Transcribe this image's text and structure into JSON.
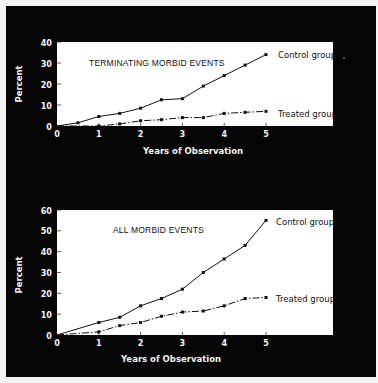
{
  "colors": {
    "background": "#050505",
    "plot_area": "#ffffff",
    "line": "#111111",
    "text_light": "#f2f2f2"
  },
  "charts": [
    {
      "id": "top",
      "title": "TERMINATING MORBID EVENTS",
      "ylabel": "Percent",
      "xlabel": "Years of Observation",
      "y_ticks": [
        "0",
        "10",
        "20",
        "30",
        "40"
      ],
      "x_ticks": [
        "0",
        "1",
        "2",
        "3",
        "4",
        "5"
      ],
      "series_labels": {
        "control": "Control group",
        "treated": "Treated group"
      }
    },
    {
      "id": "bottom",
      "title": "ALL MORBID EVENTS",
      "ylabel": "Percent",
      "xlabel": "Years of Observation",
      "y_ticks": [
        "0",
        "10",
        "20",
        "30",
        "40",
        "50",
        "60"
      ],
      "x_ticks": [
        "0",
        "1",
        "2",
        "3",
        "4",
        "5"
      ],
      "series_labels": {
        "control": "Control group",
        "treated": "Treated group"
      }
    }
  ],
  "chart_data": [
    {
      "type": "line",
      "title": "TERMINATING MORBID EVENTS",
      "xlabel": "Years of Observation",
      "ylabel": "Percent",
      "x": [
        0,
        0.5,
        1,
        1.5,
        2,
        2.5,
        3,
        3.5,
        4,
        4.5,
        5
      ],
      "series": [
        {
          "name": "Control group",
          "style": "solid",
          "x": [
            0,
            0.5,
            1,
            1.5,
            2,
            2.5,
            3,
            3.5,
            4,
            4.5,
            5
          ],
          "values": [
            0,
            1.5,
            4.5,
            6,
            8.5,
            12.5,
            13,
            19,
            24,
            29,
            34
          ]
        },
        {
          "name": "Treated group",
          "style": "dash-dot",
          "x": [
            1,
            1.5,
            2,
            2.5,
            3,
            3.5,
            4,
            4.5,
            5
          ],
          "values": [
            0,
            1,
            2.5,
            3,
            4,
            4,
            6,
            6.5,
            7
          ]
        }
      ],
      "xlim": [
        0,
        6.5
      ],
      "ylim": [
        0,
        40
      ],
      "grid": false,
      "legend": "inline labels at right end of lines"
    },
    {
      "type": "line",
      "title": "ALL MORBID EVENTS",
      "xlabel": "Years of Observation",
      "ylabel": "Percent",
      "x": [
        0,
        1,
        1.5,
        2,
        2.5,
        3,
        3.5,
        4,
        4.5,
        5
      ],
      "series": [
        {
          "name": "Control group",
          "style": "solid",
          "x": [
            0,
            1,
            1.5,
            2,
            2.5,
            3,
            3.5,
            4,
            4.5,
            5
          ],
          "values": [
            0,
            6,
            8.5,
            14,
            17.5,
            22,
            30,
            36.5,
            43,
            55
          ]
        },
        {
          "name": "Treated group",
          "style": "dash-dot",
          "x": [
            0,
            1,
            1.5,
            2,
            2.5,
            3,
            3.5,
            4,
            4.5,
            5
          ],
          "values": [
            0,
            1.5,
            4.5,
            6,
            9,
            11,
            11.5,
            14,
            17.5,
            18
          ]
        }
      ],
      "xlim": [
        0,
        6.5
      ],
      "ylim": [
        0,
        60
      ],
      "grid": false,
      "legend": "inline labels at right end of lines"
    }
  ]
}
